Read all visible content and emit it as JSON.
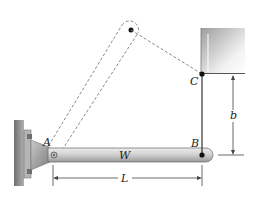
{
  "diagram": {
    "type": "statics-beam-cable",
    "labels": {
      "pivot": "A",
      "beam_end": "B",
      "cable_anchor": "C",
      "weight": "W",
      "length_dim": "L",
      "height_dim": "b"
    },
    "colors": {
      "beam_light": "#e4e4e4",
      "beam_dark": "#9a9a9a",
      "wall": "#8c8c8c",
      "dashed": "#8a8a8a",
      "line": "#333333",
      "pin": "#111111"
    }
  }
}
